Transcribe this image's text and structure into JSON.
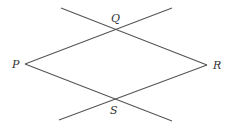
{
  "diagram": {
    "type": "geometry",
    "colors": {
      "line": "#555555",
      "label": "#333333",
      "background": "#ffffff"
    },
    "points": {
      "P": {
        "label": "P",
        "x": 25,
        "y": 64
      },
      "Q": {
        "label": "Q",
        "x": 117,
        "y": 29
      },
      "R": {
        "label": "R",
        "x": 207,
        "y": 65
      },
      "S": {
        "label": "S",
        "x": 115,
        "y": 100
      }
    },
    "lines": [
      {
        "id": "line-through-Q-R",
        "from": [
          61,
          8
        ],
        "to": [
          207,
          65
        ]
      },
      {
        "id": "line-through-P-Q",
        "from": [
          25,
          64
        ],
        "to": [
          172,
          8
        ]
      },
      {
        "id": "line-through-P-S",
        "from": [
          25,
          64
        ],
        "to": [
          172,
          121
        ]
      },
      {
        "id": "line-through-S-R",
        "from": [
          59,
          120
        ],
        "to": [
          207,
          65
        ]
      }
    ],
    "labels": {
      "P": "P",
      "Q": "Q",
      "R": "R",
      "S": "S"
    }
  }
}
